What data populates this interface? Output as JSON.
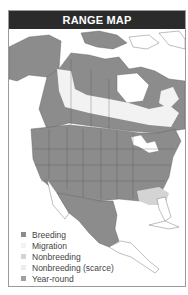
{
  "title": "RANGE MAP",
  "colors": {
    "title_bar": "#2b2b2b",
    "breeding": "#8c8c8c",
    "migration": "#f2f2f2",
    "nonbreeding": "#d4d4d4",
    "nonbreeding_scarce": "#ededed",
    "year_round": "#9a9a9a",
    "land": "#ffffff",
    "border": "#5a5a5a"
  },
  "legend": {
    "items": [
      {
        "label": "Breeding",
        "color": "#8c8c8c"
      },
      {
        "label": "Migration",
        "color": "#f2f2f2"
      },
      {
        "label": "Nonbreeding",
        "color": "#d4d4d4"
      },
      {
        "label": "Nonbreeding (scarce)",
        "color": "#ededed"
      },
      {
        "label": "Year-round",
        "color": "#a0a0a0"
      }
    ]
  },
  "map": {
    "region": "North and Central America"
  }
}
